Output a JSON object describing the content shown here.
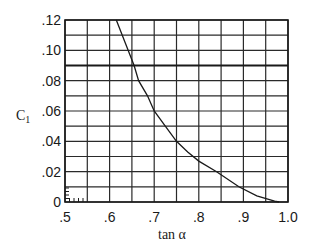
{
  "chart_data": {
    "type": "line",
    "title": "",
    "xlabel": "tan α",
    "ylabel": "C₁",
    "ylabel_base": "C",
    "ylabel_sub": "1",
    "xlim": [
      0.5,
      1.0
    ],
    "ylim": [
      0,
      0.12
    ],
    "grid": true,
    "x_ticks": [
      ".5",
      ".6",
      ".7",
      ".8",
      ".9",
      "1.0"
    ],
    "x_tick_values": [
      0.5,
      0.6,
      0.7,
      0.8,
      0.9,
      1.0
    ],
    "y_ticks": [
      "0",
      ".02",
      ".04",
      ".06",
      ".08",
      ".10",
      ".12"
    ],
    "y_tick_values": [
      0,
      0.02,
      0.04,
      0.06,
      0.08,
      0.1,
      0.12
    ],
    "minor_grid_x_step": 0.05,
    "minor_grid_y_step": 0.01,
    "reference_line": {
      "y": 0.09,
      "style": "thick horizontal"
    },
    "series": [
      {
        "name": "C1 vs tan α",
        "x": [
          0.615,
          0.635,
          0.655,
          0.665,
          0.685,
          0.7,
          0.725,
          0.75,
          0.775,
          0.8,
          0.84,
          0.89,
          0.93,
          0.97,
          0.98
        ],
        "y": [
          0.12,
          0.105,
          0.09,
          0.08,
          0.07,
          0.06,
          0.05,
          0.04,
          0.033,
          0.027,
          0.02,
          0.01,
          0.004,
          0.0005,
          0.0
        ]
      }
    ]
  }
}
